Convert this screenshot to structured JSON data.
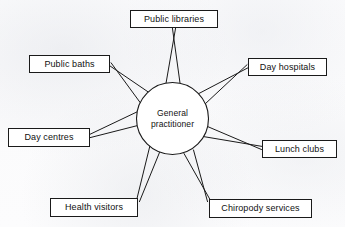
{
  "diagram": {
    "type": "radial-spoke-diagram",
    "hub": {
      "name": "general-practitioner",
      "line1": "General",
      "line2": "practitioner",
      "cx": 172.5,
      "cy": 118.5,
      "r": 36
    },
    "style": {
      "background": "#fcfcfc",
      "stroke": "#1a1a1a",
      "box_fill": "#ffffff",
      "text": "#111111"
    },
    "nodes": [
      {
        "name": "public-libraries",
        "label": "Public libraries",
        "x": 130,
        "y": 10,
        "w": 88,
        "h": 18,
        "anchor": {
          "x": 174,
          "y": 28
        },
        "hub_a": {
          "x": 166,
          "y": 83.4
        },
        "hub_b": {
          "x": 180,
          "y": 83.0
        }
      },
      {
        "name": "public-baths",
        "label": "Public baths",
        "x": 29,
        "y": 55,
        "w": 81,
        "h": 18,
        "anchor": {
          "x": 110,
          "y": 64
        },
        "hub_a": {
          "x": 140.5,
          "y": 103.0
        },
        "hub_b": {
          "x": 149.0,
          "y": 92.5
        }
      },
      {
        "name": "day-hospitals",
        "label": "Day hospitals",
        "x": 248,
        "y": 58,
        "w": 79,
        "h": 18,
        "anchor": {
          "x": 248,
          "y": 66
        },
        "hub_a": {
          "x": 197.0,
          "y": 94.5
        },
        "hub_b": {
          "x": 204.5,
          "y": 104.5
        }
      },
      {
        "name": "day-centres",
        "label": "Day centres",
        "x": 8,
        "y": 128,
        "w": 82,
        "h": 19,
        "anchor": {
          "x": 90,
          "y": 136
        },
        "hub_a": {
          "x": 136.8,
          "y": 112.0
        },
        "hub_b": {
          "x": 137.8,
          "y": 125.5
        }
      },
      {
        "name": "lunch-clubs",
        "label": "Lunch clubs",
        "x": 262,
        "y": 140,
        "w": 75,
        "h": 18,
        "anchor": {
          "x": 262,
          "y": 148
        },
        "hub_a": {
          "x": 207.5,
          "y": 126.5
        },
        "hub_b": {
          "x": 203.0,
          "y": 136.5
        }
      },
      {
        "name": "health-visitors",
        "label": "Health visitors",
        "x": 50,
        "y": 198,
        "w": 88,
        "h": 19,
        "anchor": {
          "x": 138,
          "y": 201
        },
        "hub_a": {
          "x": 150.0,
          "y": 145.5
        },
        "hub_b": {
          "x": 159.5,
          "y": 152.5
        }
      },
      {
        "name": "chiropody-services",
        "label": "Chiropody services",
        "x": 209,
        "y": 199,
        "w": 103,
        "h": 19,
        "anchor": {
          "x": 209,
          "y": 201
        },
        "hub_a": {
          "x": 193.5,
          "y": 150.0
        },
        "hub_b": {
          "x": 184.0,
          "y": 153.5
        }
      }
    ]
  }
}
